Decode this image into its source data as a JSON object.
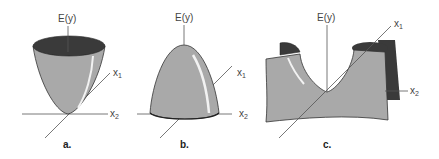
{
  "figure": {
    "panels": [
      {
        "id": "a",
        "label": "a.",
        "shape": "paraboloid-upward-bowl",
        "axes": {
          "vertical": "E(y)",
          "x1": "x",
          "x1_sub": "1",
          "x2": "x",
          "x2_sub": "2"
        }
      },
      {
        "id": "b",
        "label": "b.",
        "shape": "paraboloid-downward-dome",
        "axes": {
          "vertical": "E(y)",
          "x1": "x",
          "x1_sub": "1",
          "x2": "x",
          "x2_sub": "2"
        }
      },
      {
        "id": "c",
        "label": "c.",
        "shape": "saddle-surface",
        "axes": {
          "vertical": "E(y)",
          "x1": "x",
          "x1_sub": "1",
          "x2": "x",
          "x2_sub": "2"
        }
      }
    ],
    "colors": {
      "surface": "#a9a9a9",
      "surface_dark": "#3a3a3a",
      "highlight": "#f2f2f2",
      "axis": "#555555"
    }
  }
}
